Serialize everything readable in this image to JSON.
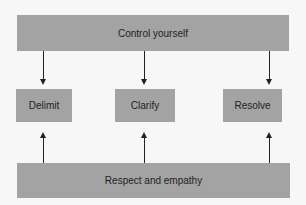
{
  "diagram": {
    "top_bar": {
      "label": "Control yourself"
    },
    "boxes": [
      {
        "label": "Delimit"
      },
      {
        "label": "Clarify"
      },
      {
        "label": "Resolve"
      }
    ],
    "bottom_bar": {
      "label": "Respect and empathy"
    },
    "colors": {
      "fill": "#a3a3a3",
      "background": "#f7f7f7",
      "arrow": "#222222"
    }
  }
}
